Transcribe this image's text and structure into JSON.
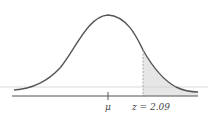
{
  "diagram": {
    "type": "normal-distribution",
    "mean_label": "μ",
    "z_label": "z = 2.09",
    "z_value": 2.09,
    "shaded_region": "right tail beyond z",
    "colors": {
      "curve": "#555555",
      "axis": "#555555",
      "shade": "#e6e6e6",
      "dashed_line": "#999999",
      "reference_line": "#cfcfcf"
    }
  }
}
